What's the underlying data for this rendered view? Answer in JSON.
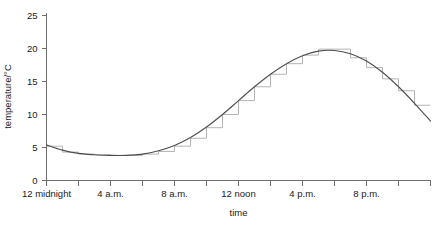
{
  "chart_data": {
    "type": "line",
    "title": "",
    "subtitle": "",
    "xlabel": "time",
    "ylabel": "temperature/°C",
    "xlim": [
      0,
      24
    ],
    "ylim": [
      0,
      27
    ],
    "grid": false,
    "legend": "none",
    "y_ticks": [
      0,
      5,
      10,
      15,
      20,
      25
    ],
    "y_tick_labels": [
      "0",
      "5",
      "10",
      "15",
      "20",
      "25"
    ],
    "x_ticks": [
      0,
      2,
      4,
      6,
      8,
      10,
      12,
      14,
      16,
      18,
      20,
      22,
      24
    ],
    "x_tick_labels": [
      "12 midnight",
      "",
      "4 a.m.",
      "",
      "8 a.m.",
      "",
      "12 noon",
      "",
      "4 p.m.",
      "",
      "8 p.m.",
      "",
      ""
    ],
    "x_labeled_ticks": [
      {
        "value": 0,
        "label": "12 midnight"
      },
      {
        "value": 4,
        "label": "4 a.m."
      },
      {
        "value": 8,
        "label": "8 a.m."
      },
      {
        "value": 12,
        "label": "12 noon"
      },
      {
        "value": 16,
        "label": "4 p.m."
      },
      {
        "value": 20,
        "label": "8 p.m."
      }
    ],
    "series": [
      {
        "name": "hourly temperature (step histogram)",
        "type": "step",
        "color": "#b4b4b4",
        "x": [
          0,
          1,
          2,
          3,
          4,
          5,
          6,
          7,
          8,
          9,
          10,
          11,
          12,
          13,
          14,
          15,
          16,
          17,
          18,
          19,
          20,
          21,
          22,
          23,
          24
        ],
        "values": [
          5.2,
          4.3,
          4.0,
          3.9,
          3.8,
          3.8,
          4.0,
          4.4,
          5.2,
          6.4,
          8.0,
          10.0,
          12.1,
          14.2,
          16.1,
          17.7,
          19.0,
          19.9,
          19.9,
          18.6,
          17.1,
          15.4,
          13.6,
          11.4,
          8.6
        ]
      },
      {
        "name": "smoothed temperature curve",
        "type": "line",
        "color": "#4f4f4f",
        "x": [
          0,
          1,
          2,
          3,
          4,
          5,
          6,
          7,
          8,
          9,
          10,
          11,
          12,
          13,
          14,
          15,
          16,
          17,
          18,
          19,
          20,
          21,
          22,
          23,
          24
        ],
        "values": [
          5.4,
          4.6,
          4.1,
          3.9,
          3.8,
          3.8,
          4.0,
          4.5,
          5.3,
          6.5,
          8.1,
          10.0,
          12.1,
          14.2,
          16.1,
          17.7,
          18.9,
          19.6,
          19.7,
          19.2,
          18.1,
          16.4,
          14.2,
          11.7,
          9.0
        ]
      }
    ],
    "annotations": []
  }
}
